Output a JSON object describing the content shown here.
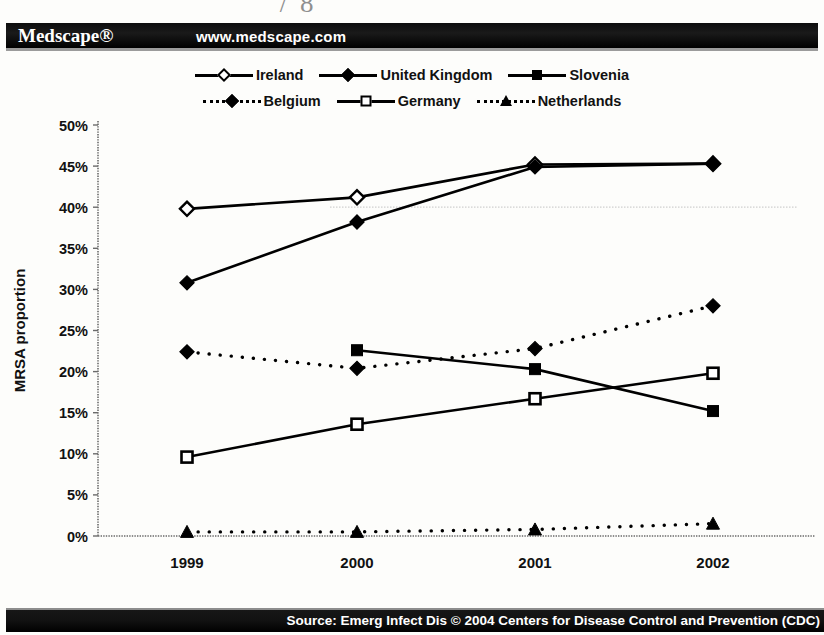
{
  "header": {
    "brand": "Medscape®",
    "url": "www.medscape.com",
    "scan_fragment": "˜ / 8"
  },
  "footer": {
    "source": "Source: Emerg Infect Dis © 2004 Centers for Disease Control and Prevention (CDC)"
  },
  "legend": {
    "row1": [
      {
        "label": "Ireland",
        "marker": "diamond-open",
        "line": "solid"
      },
      {
        "label": "United Kingdom",
        "marker": "diamond-fill",
        "line": "solid"
      },
      {
        "label": "Slovenia",
        "marker": "square-fill",
        "line": "solid"
      }
    ],
    "row2": [
      {
        "label": "Belgium",
        "marker": "diamond-fill",
        "line": "dotted"
      },
      {
        "label": "Germany",
        "marker": "square-open",
        "line": "solid"
      },
      {
        "label": "Netherlands",
        "marker": "triangle-fill",
        "line": "dotted"
      }
    ]
  },
  "chart_data": {
    "type": "line",
    "title": "",
    "xlabel": "",
    "ylabel": "MRSA proportion",
    "categories": [
      "1999",
      "2000",
      "2001",
      "2002"
    ],
    "ylim": [
      0,
      50
    ],
    "ytick_values": [
      0,
      5,
      10,
      15,
      20,
      25,
      30,
      35,
      40,
      45,
      50
    ],
    "ytick_labels": [
      "0%",
      "5%",
      "10%",
      "15%",
      "20%",
      "25%",
      "30%",
      "35%",
      "40%",
      "45%",
      "50%"
    ],
    "grid": "single faint horizontal gridline at 40%",
    "legend_position": "top-center",
    "series": [
      {
        "name": "Ireland",
        "marker": "diamond-open",
        "line": "solid",
        "values": [
          39.8,
          41.2,
          45.2,
          45.3
        ]
      },
      {
        "name": "United Kingdom",
        "marker": "diamond-fill",
        "line": "solid",
        "values": [
          30.8,
          38.2,
          44.9,
          45.3
        ]
      },
      {
        "name": "Slovenia",
        "marker": "square-fill",
        "line": "solid",
        "values": [
          null,
          22.6,
          20.3,
          15.2
        ]
      },
      {
        "name": "Belgium",
        "marker": "diamond-fill",
        "line": "dotted",
        "values": [
          22.4,
          20.4,
          22.8,
          28.0
        ]
      },
      {
        "name": "Germany",
        "marker": "square-open",
        "line": "solid",
        "values": [
          9.6,
          13.6,
          16.7,
          19.8
        ]
      },
      {
        "name": "Netherlands",
        "marker": "triangle-fill",
        "line": "dotted",
        "values": [
          0.5,
          0.5,
          0.8,
          1.5
        ]
      }
    ]
  },
  "colors": {
    "ink": "#000000",
    "banner_bg": "#000000",
    "banner_text": "#ffffff",
    "page_bg": "#fdfdfb"
  }
}
